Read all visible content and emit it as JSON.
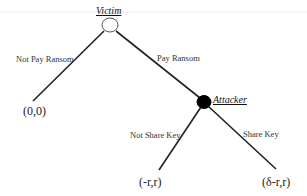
{
  "diagram": {
    "type": "game-tree",
    "nodes": {
      "victim": {
        "label": "Victim",
        "fill": "#ffffff"
      },
      "attacker": {
        "label": "Attacker",
        "fill": "#000000"
      }
    },
    "edges": {
      "not_pay": {
        "label": "Not Pay Ransom"
      },
      "pay": {
        "label": "Pay Ransom"
      },
      "not_share": {
        "label": "Not Share Key"
      },
      "share": {
        "label": "Share Key"
      }
    },
    "payoffs": {
      "not_pay": "(0,0)",
      "not_share": "(-r,r)",
      "share": "(δ-r,r)"
    },
    "colors": {
      "line": "#222222",
      "rule": "#e6e6e6"
    }
  }
}
